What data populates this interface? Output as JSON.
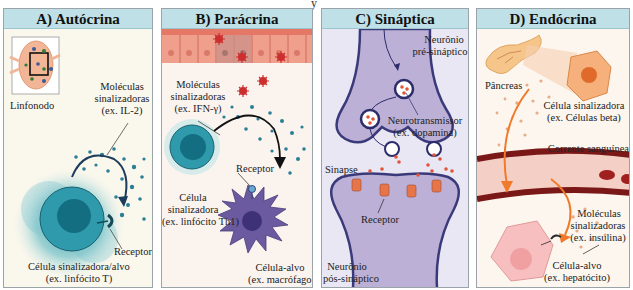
{
  "figure": {
    "top_cut_glyph": "y",
    "colors": {
      "header_bg": "#bfe0e6",
      "panel_bg_a": "#faf7ec",
      "panel_bg_b": "#fbf3ee",
      "panel_bg_c": "#e8e7f3",
      "panel_bg_d": "#fcf6ee",
      "teal_cell": "#2a93a6",
      "neuron_purple": "#bcb0d6",
      "neuron_outline": "#3a3a7a",
      "macrophage": "#6b5aa0",
      "epithelium": "#ee9a88",
      "hormone_orange": "#f08a3a",
      "vessel": "#8a1f1f"
    },
    "panels": [
      {
        "id": "A",
        "title": "A) Autócrina",
        "labels": {
          "organ": "Linfonodo",
          "molecules_1": "Moléculas",
          "molecules_2": "sinalizadoras",
          "molecules_3": "(ex. IL-2)",
          "receptor": "Receptor",
          "cell_1": "Célula sinalizadora/alvo",
          "cell_2": "(ex. linfócito T)"
        }
      },
      {
        "id": "B",
        "title": "B) Parácrina",
        "labels": {
          "molecules_1": "Moléculas",
          "molecules_2": "sinalizadoras",
          "molecules_3": "(ex. IFN-γ)",
          "signal_cell_1": "Célula",
          "signal_cell_2": "sinalizadora",
          "signal_cell_3": "(ex. linfócito Th1)",
          "receptor": "Receptor",
          "target_1": "Célula-alvo",
          "target_2": "(ex. macrófago)"
        }
      },
      {
        "id": "C",
        "title": "C) Sináptica",
        "labels": {
          "pre_1": "Neurônio",
          "pre_2": "pré-sináptico",
          "nt_1": "Neurotransmissor",
          "nt_2": "(ex. dopamina)",
          "synapse": "Sinapse",
          "receptor": "Receptor",
          "post_1": "Neurônio",
          "post_2": "pós-sináptico"
        }
      },
      {
        "id": "D",
        "title": "D) Endócrina",
        "labels": {
          "organ": "Pâncreas",
          "signal_cell_1": "Célula sinalizadora",
          "signal_cell_2": "(ex. Células beta)",
          "blood": "Corrente sanguínea",
          "molecules_1": "Moléculas",
          "molecules_2": "sinalizadoras",
          "molecules_3": "(ex. insulina)",
          "target_1": "Célula-alvo",
          "target_2": "(ex. hepatócito)"
        }
      }
    ]
  }
}
